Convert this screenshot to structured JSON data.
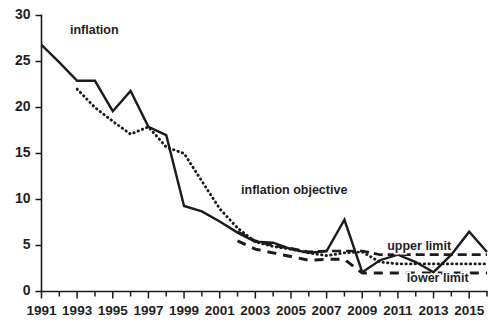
{
  "chart_data": {
    "type": "line",
    "title": "",
    "xlabel": "",
    "ylabel": "",
    "xlim": [
      1991,
      2016
    ],
    "ylim": [
      0,
      30
    ],
    "grid": false,
    "legend": "inline annotations",
    "y_ticks": [
      0,
      5,
      10,
      15,
      20,
      25,
      30
    ],
    "x_ticks": [
      1991,
      1992,
      1993,
      1994,
      1995,
      1996,
      1997,
      1998,
      1999,
      2000,
      2001,
      2002,
      2003,
      2004,
      2005,
      2006,
      2007,
      2008,
      2009,
      2010,
      2011,
      2012,
      2013,
      2014,
      2015,
      2016
    ],
    "x_tick_labels": [
      "1991",
      "",
      "1993",
      "",
      "1995",
      "",
      "1997",
      "",
      "1999",
      "",
      "2001",
      "",
      "2003",
      "",
      "2005",
      "",
      "2007",
      "",
      "2009",
      "",
      "2011",
      "",
      "2013",
      "",
      "2015",
      ""
    ],
    "series": [
      {
        "name": "inflation",
        "style": "solid",
        "x": [
          1991,
          1992,
          1993,
          1994,
          1995,
          1996,
          1997,
          1998,
          1999,
          2000,
          2001,
          2002,
          2003,
          2004,
          2005,
          2006,
          2007,
          2008,
          2009,
          2010,
          2011,
          2012,
          2013,
          2014,
          2015,
          2016
        ],
        "values": [
          26.8,
          24.9,
          22.9,
          22.9,
          19.6,
          21.8,
          17.9,
          17.0,
          9.3,
          8.7,
          7.6,
          6.4,
          5.4,
          5.3,
          4.6,
          4.2,
          4.4,
          7.8,
          2.1,
          3.4,
          4.0,
          3.2,
          2.1,
          4.0,
          6.5,
          4.3
        ]
      },
      {
        "name": "inflation objective",
        "style": "dotted",
        "x": [
          1993,
          1994,
          1995,
          1996,
          1997,
          1998,
          1999,
          2000,
          2001,
          2002,
          2003,
          2004,
          2005,
          2006,
          2007,
          2008,
          2009,
          2010,
          2011,
          2012,
          2013,
          2014,
          2015,
          2016
        ],
        "values": [
          22.0,
          20.0,
          18.5,
          17.1,
          17.9,
          15.7,
          15.0,
          12.0,
          9.0,
          6.9,
          5.4,
          4.9,
          4.6,
          4.2,
          3.9,
          4.2,
          4.3,
          3.2,
          3.0,
          3.0,
          3.0,
          3.0,
          3.0,
          3.0
        ]
      },
      {
        "name": "upper limit",
        "style": "dashed-long",
        "x": [
          2002,
          2003,
          2004,
          2005,
          2006,
          2007,
          2008,
          2009,
          2010,
          2011,
          2012,
          2013,
          2014,
          2015,
          2016
        ],
        "values": [
          6.5,
          5.5,
          5.0,
          4.7,
          4.3,
          4.4,
          4.4,
          4.4,
          4.0,
          4.0,
          4.0,
          4.0,
          4.0,
          4.0,
          4.0
        ]
      },
      {
        "name": "lower limit",
        "style": "dashed",
        "x": [
          2002,
          2003,
          2004,
          2005,
          2006,
          2007,
          2008,
          2009,
          2010,
          2011,
          2012,
          2013,
          2014,
          2015,
          2016
        ],
        "values": [
          5.5,
          4.6,
          4.2,
          3.8,
          3.4,
          3.5,
          3.5,
          2.0,
          2.0,
          2.0,
          2.0,
          2.0,
          2.0,
          2.0,
          2.0
        ]
      }
    ],
    "annotations": [
      {
        "text": "inflation",
        "x": 1992.6,
        "y": 28.0,
        "anchor": "start"
      },
      {
        "text": "inflation objective",
        "x": 2002.2,
        "y": 10.6,
        "anchor": "start"
      },
      {
        "text": "upper limit",
        "x": 2010.4,
        "y": 4.55,
        "anchor": "start"
      },
      {
        "text": "lower limit",
        "x": 2011.5,
        "y": 1.05,
        "anchor": "start"
      }
    ]
  },
  "colors": {
    "ink": "#1b1b1b",
    "background": "#ffffff"
  }
}
